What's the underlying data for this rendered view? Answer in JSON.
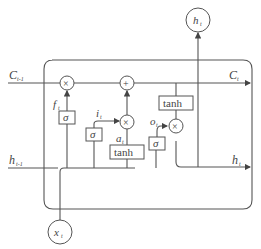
{
  "diagram": {
    "title": "",
    "labels": {
      "c_prev": "C",
      "c_prev_sub": "t-1",
      "c_next": "C",
      "c_next_sub": "t",
      "h_prev": "h",
      "h_prev_sub": "t-1",
      "h_next": "h",
      "h_next_sub": "t",
      "h_out": "h",
      "h_out_sub": "t",
      "x_in": "x",
      "x_in_sub": "t",
      "f_gate": "f",
      "f_gate_sub": "t",
      "i_gate": "i",
      "i_gate_sub": "t",
      "a_gate": "a",
      "a_gate_sub": "t",
      "o_gate": "o",
      "o_gate_sub": "t"
    },
    "operators": {
      "mult": "×",
      "add": "+"
    },
    "blocks": {
      "sigma": "σ",
      "tanh": "tanh"
    }
  }
}
